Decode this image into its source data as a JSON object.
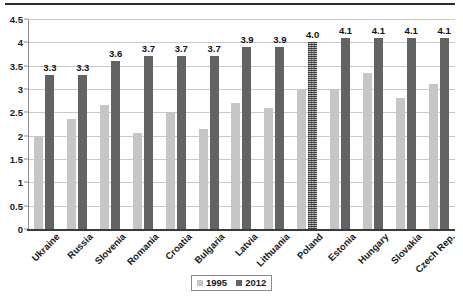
{
  "chart_data": {
    "type": "bar",
    "title": "",
    "xlabel": "",
    "ylabel": "",
    "ylim": [
      0,
      4.5
    ],
    "ytick_step": 0.5,
    "yticks": [
      "0",
      "0.5",
      "1",
      "1.5",
      "2",
      "2.5",
      "3",
      "3.5",
      "4",
      "4.5"
    ],
    "grid": true,
    "legend_position": "bottom-right",
    "categories": [
      "Ukraine",
      "Russia",
      "Slovenia",
      "Romania",
      "Croatia",
      "Bulgaria",
      "Latvia",
      "Lithuania",
      "Poland",
      "Estonia",
      "Hungary",
      "Slovakia",
      "Czech Rep."
    ],
    "series": [
      {
        "name": "1995",
        "color": "#c6c6c6",
        "values": [
          2.0,
          2.35,
          2.65,
          2.05,
          2.5,
          2.15,
          2.7,
          2.6,
          3.0,
          3.0,
          3.35,
          2.8,
          3.1
        ],
        "labels": [
          "",
          "",
          "",
          "",
          "",
          "",
          "",
          "",
          "",
          "",
          "",
          "",
          ""
        ]
      },
      {
        "name": "2012",
        "color": "#636363",
        "values": [
          3.3,
          3.3,
          3.6,
          3.7,
          3.7,
          3.7,
          3.9,
          3.9,
          4.0,
          4.1,
          4.1,
          4.1,
          4.1
        ],
        "labels": [
          "3.3",
          "3.3",
          "3.6",
          "3.7",
          "3.7",
          "3.7",
          "3.9",
          "3.9",
          "4.0",
          "4.1",
          "4.1",
          "4.1",
          "4.1"
        ],
        "textured_indices": [
          8
        ]
      }
    ]
  },
  "legend": {
    "items": [
      {
        "label": "1995",
        "color": "#c6c6c6"
      },
      {
        "label": "2012",
        "color": "#636363"
      }
    ]
  }
}
